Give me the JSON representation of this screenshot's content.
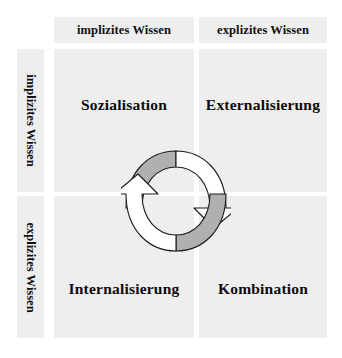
{
  "diagram": {
    "column_headers": [
      {
        "key": "implicit",
        "label": "implizites Wissen"
      },
      {
        "key": "explicit",
        "label": "explizites Wissen"
      }
    ],
    "row_headers": [
      {
        "key": "implicit",
        "label": "implizites Wissen"
      },
      {
        "key": "explicit",
        "label": "explizites Wissen"
      }
    ],
    "quadrants": [
      {
        "key": "sozialisation",
        "label": "Sozialisation",
        "row": "implizites Wissen",
        "column": "implizites Wissen"
      },
      {
        "key": "externalisierung",
        "label": "Externalisierung",
        "row": "implizites Wissen",
        "column": "explizites Wissen"
      },
      {
        "key": "internalisierung",
        "label": "Internalisierung",
        "row": "explizites Wissen",
        "column": "implizites Wissen"
      },
      {
        "key": "kombination",
        "label": "Kombination",
        "row": "explizites Wissen",
        "column": "explizites Wissen"
      }
    ],
    "cycle": {
      "name": "circular-conversion-arrows",
      "arrows": [
        {
          "key": "top-arrow",
          "direction": "left-to-right",
          "tail_fill": "#b0b0b0",
          "head_fill": "#ffffff"
        },
        {
          "key": "bottom-arrow",
          "direction": "right-to-left",
          "tail_fill": "#b0b0b0",
          "head_fill": "#ffffff"
        }
      ]
    },
    "colors": {
      "panel_background": "#eeeeee",
      "page_background": "#ffffff",
      "text": "#101010",
      "arrow_shaded": "#b0b0b0",
      "arrow_outline": "#1a1a1a"
    }
  }
}
